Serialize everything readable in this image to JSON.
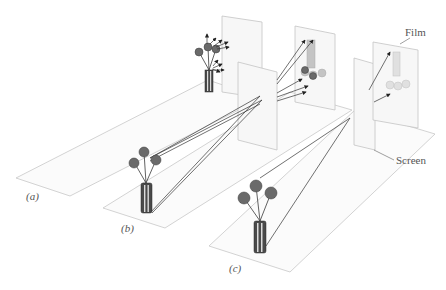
{
  "figure": {
    "panels": [
      {
        "id": "a",
        "label": "(a)"
      },
      {
        "id": "b",
        "label": "(b)"
      },
      {
        "id": "c",
        "label": "(c)"
      }
    ],
    "callouts": {
      "film": "Film",
      "screen": "Screen"
    }
  }
}
